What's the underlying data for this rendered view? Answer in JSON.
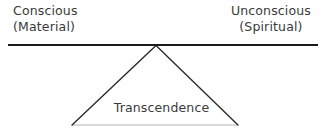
{
  "diagram": {
    "type": "balance-fulcrum",
    "background_color": "#ffffff",
    "beam": {
      "name": "horizontal-beam",
      "color": "#1a1a1a",
      "x1": 8,
      "y1": 45,
      "x2": 318,
      "y2": 45,
      "stroke_width": 2
    },
    "triangle": {
      "name": "fulcrum-triangle",
      "apex_x": 156,
      "apex_y": 45,
      "left_x": 72,
      "left_y": 125,
      "right_x": 238,
      "right_y": 125,
      "side_color": "#2b2b2b",
      "side_stroke_width": 1.4,
      "base_color": "#b4b4b4",
      "base_stroke_width": 1
    },
    "labels": {
      "left": {
        "line1": "Conscious",
        "line2": "(Material)"
      },
      "right": {
        "line1": "Unconscious",
        "line2": "(Spiritual)"
      },
      "center": {
        "line1": "Transcendence"
      }
    },
    "text_color": "#3a3a3a"
  }
}
